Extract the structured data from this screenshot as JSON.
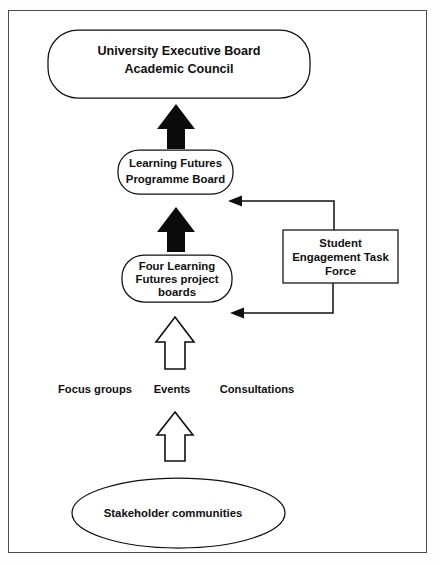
{
  "diagram": {
    "nodes": {
      "executive_board": {
        "shape": "rounded-rectangle",
        "line1": "University Executive Board",
        "line2": "Academic Council"
      },
      "programme_board": {
        "shape": "rounded-rectangle",
        "line1": "Learning Futures",
        "line2": "Programme Board"
      },
      "project_boards": {
        "shape": "rounded-rectangle",
        "line1": "Four Learning",
        "line2": "Futures project",
        "line3": "boards"
      },
      "task_force": {
        "shape": "rectangle",
        "line1": "Student",
        "line2": "Engagement Task",
        "line3": "Force"
      },
      "stakeholders": {
        "shape": "ellipse",
        "line1": "Stakeholder communities"
      }
    },
    "engagement_labels": [
      {
        "label": "Focus groups"
      },
      {
        "label": "Events"
      },
      {
        "label": "Consultations"
      }
    ],
    "connectors": [
      {
        "name": "project-boards-to-programme-board",
        "style": "solid-block-arrow",
        "direction": "up"
      },
      {
        "name": "programme-board-to-executive-board",
        "style": "solid-block-arrow",
        "direction": "up"
      },
      {
        "name": "engagement-to-project-boards",
        "style": "hollow-block-arrow",
        "direction": "up"
      },
      {
        "name": "stakeholders-to-engagement",
        "style": "hollow-block-arrow",
        "direction": "up"
      },
      {
        "name": "task-force-to-programme-board",
        "style": "elbow-line-arrow",
        "direction": "left"
      },
      {
        "name": "task-force-to-project-boards",
        "style": "elbow-line-arrow",
        "direction": "left"
      }
    ],
    "colors": {
      "stroke": "#0f0f0f",
      "fill": "#ffffff",
      "page": "#ffffff",
      "frame": "#4a4a4a"
    }
  }
}
